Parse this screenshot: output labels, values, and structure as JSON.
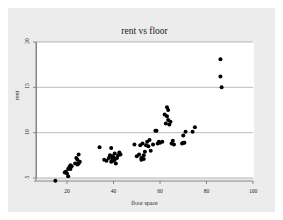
{
  "chart_data": {
    "type": "scatter",
    "title": "rent vs floor",
    "xlabel": "floor space",
    "ylabel": "rent",
    "xlim": [
      14,
      100
    ],
    "ylim": [
      4.6,
      20
    ],
    "xticks": [
      20,
      40,
      60,
      80,
      100
    ],
    "yticks": [
      5,
      10,
      15,
      20
    ],
    "grid": "horizontal",
    "legend": null,
    "marker": {
      "shape": "circle",
      "color": "#000000",
      "size": 2.0
    },
    "x": [
      15.0,
      19.0,
      19.5,
      20.0,
      20.5,
      20.5,
      21.0,
      21.5,
      21.5,
      22.0,
      23.5,
      24.0,
      24.5,
      24.5,
      25.0,
      25.0,
      25.5,
      34.0,
      36.0,
      37.0,
      38.0,
      38.5,
      39.0,
      39.0,
      39.5,
      39.5,
      40.0,
      40.0,
      40.5,
      40.5,
      41.0,
      41.5,
      42.0,
      42.5,
      43.0,
      49.0,
      50.0,
      51.0,
      51.5,
      52.0,
      52.0,
      52.5,
      53.0,
      53.0,
      53.5,
      54.0,
      54.5,
      55.0,
      55.5,
      56.0,
      57.0,
      58.0,
      58.5,
      59.0,
      59.5,
      60.0,
      61.0,
      62.0,
      62.5,
      63.0,
      63.0,
      63.5,
      63.5,
      64.0,
      64.5,
      65.0,
      65.5,
      66.0,
      69.5,
      70.0,
      70.0,
      70.5,
      71.0,
      74.0,
      75.0,
      86.0,
      86.0,
      86.5
    ],
    "y": [
      4.7,
      5.6,
      5.7,
      5.5,
      6.0,
      5.2,
      6.2,
      6.4,
      6.0,
      6.3,
      6.6,
      7.2,
      6.5,
      7.0,
      6.6,
      7.6,
      6.8,
      8.4,
      7.0,
      6.9,
      7.2,
      7.5,
      6.8,
      8.3,
      7.1,
      7.4,
      6.9,
      7.3,
      7.0,
      7.7,
      6.6,
      7.2,
      7.5,
      7.8,
      7.6,
      8.7,
      7.4,
      7.6,
      8.6,
      7.2,
      7.0,
      8.8,
      7.5,
      7.1,
      7.9,
      8.6,
      9.0,
      8.5,
      9.2,
      8.0,
      8.7,
      10.2,
      10.2,
      8.8,
      9.0,
      8.9,
      9.0,
      12.0,
      11.0,
      12.8,
      11.8,
      12.5,
      11.4,
      10.9,
      11.2,
      8.8,
      9.1,
      8.7,
      8.8,
      9.7,
      8.9,
      8.9,
      10.1,
      10.1,
      10.6,
      18.1,
      16.2,
      15.0
    ]
  }
}
